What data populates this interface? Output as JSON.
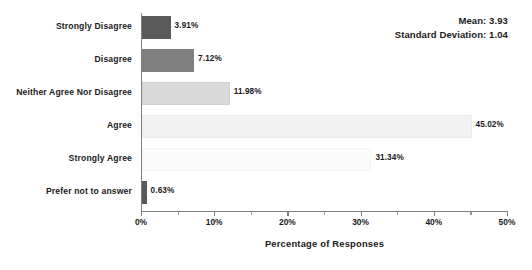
{
  "chart_data": {
    "type": "bar",
    "orientation": "horizontal",
    "title": "",
    "xlabel": "Percentage of Responses",
    "ylabel": "",
    "xlim": [
      0,
      50
    ],
    "xtick_labels": [
      "0%",
      "10%",
      "20%",
      "30%",
      "40%",
      "50%"
    ],
    "xtick_values": [
      0,
      10,
      20,
      30,
      40,
      50
    ],
    "minor_ticks": true,
    "grid": false,
    "legend": "none",
    "categories": [
      "Strongly Disagree",
      "Disagree",
      "Neither Agree Nor Disagree",
      "Agree",
      "Strongly Agree",
      "Prefer not to answer"
    ],
    "values": [
      3.91,
      7.12,
      11.98,
      45.02,
      31.34,
      0.63
    ],
    "value_labels": [
      "3.91%",
      "7.12%",
      "11.98%",
      "45.02%",
      "31.34%",
      "0.63%"
    ],
    "bar_colors": [
      "#595959",
      "#808080",
      "#d9d9d9",
      "#f2f2f2",
      "#fbfbfb",
      "#595959"
    ],
    "bar_border_colors": [
      "#595959",
      "#808080",
      "#d0d0d0",
      "#ececec",
      "#f4f4f4",
      "#595959"
    ],
    "annotations": [
      "Mean: 3.93",
      "Standard Deviation: 1.04"
    ]
  },
  "annotation": {
    "mean": "Mean: 3.93",
    "std": "Standard Deviation: 1.04"
  },
  "axis": {
    "x_title": "Percentage of Responses"
  }
}
